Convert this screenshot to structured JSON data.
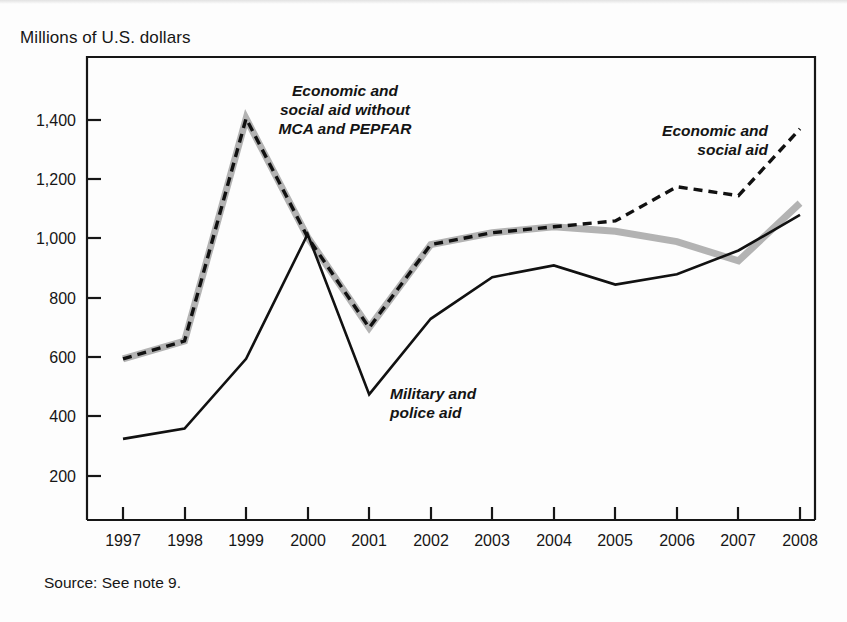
{
  "figure": {
    "axis_title": "Millions of U.S. dollars",
    "source_note": "Source: See note 9."
  },
  "annotations": {
    "series_without": [
      "Economic and",
      "social aid without",
      "MCA and PEPFAR"
    ],
    "series_total": [
      "Economic and",
      "social aid"
    ],
    "series_military": [
      "Military and",
      "police aid"
    ]
  },
  "colors": {
    "axis": "#161616",
    "text": "#161616",
    "military_line": "#111111",
    "total_aid_line": "#111111",
    "without_mca_line": "#b3b3b3",
    "without_mca_dash": "#111111",
    "background": "#fdfdfd"
  },
  "chart_data": {
    "type": "line",
    "title": "",
    "subtitle": "",
    "xlabel": "",
    "ylabel": "Millions of U.S. dollars",
    "grid": false,
    "legend": "annotations-inline",
    "xlim": [
      1997,
      2008
    ],
    "ylim": [
      0,
      1500
    ],
    "yticks": [
      200,
      400,
      600,
      800,
      1000,
      1200,
      1400
    ],
    "ytick_labels": [
      "200",
      "400",
      "600",
      "800",
      "1,000",
      "1,200",
      "1,400"
    ],
    "x": [
      1997,
      1998,
      1999,
      2000,
      2001,
      2002,
      2003,
      2004,
      2005,
      2006,
      2007,
      2008
    ],
    "xtick_labels": [
      "1997",
      "1998",
      "1999",
      "2000",
      "2001",
      "2002",
      "2003",
      "2004",
      "2005",
      "2006",
      "2007",
      "2008"
    ],
    "series": [
      {
        "name": "Military and police aid",
        "style": "solid-black",
        "values": [
          325,
          360,
          595,
          1015,
          475,
          730,
          870,
          910,
          845,
          880,
          960,
          1080
        ]
      },
      {
        "name": "Economic and social aid",
        "style": "dashed-black",
        "values": [
          595,
          655,
          1405,
          1005,
          700,
          980,
          1020,
          1040,
          1060,
          1175,
          1145,
          1370
        ]
      },
      {
        "name": "Economic and social aid without MCA and PEPFAR",
        "style": "thick-gray",
        "values": [
          595,
          655,
          1405,
          1005,
          700,
          980,
          1020,
          1040,
          1025,
          990,
          925,
          1120
        ]
      }
    ],
    "notes": [
      "The dashed black series and the thick gray series coincide from 1997 through 2004.",
      "Economic and social aid peaks in 1999 at about 1,405 million dollars.",
      "Military and police aid peaks locally in 2000 at about 1,015 million dollars and bottoms in 2001 at about 475."
    ]
  }
}
